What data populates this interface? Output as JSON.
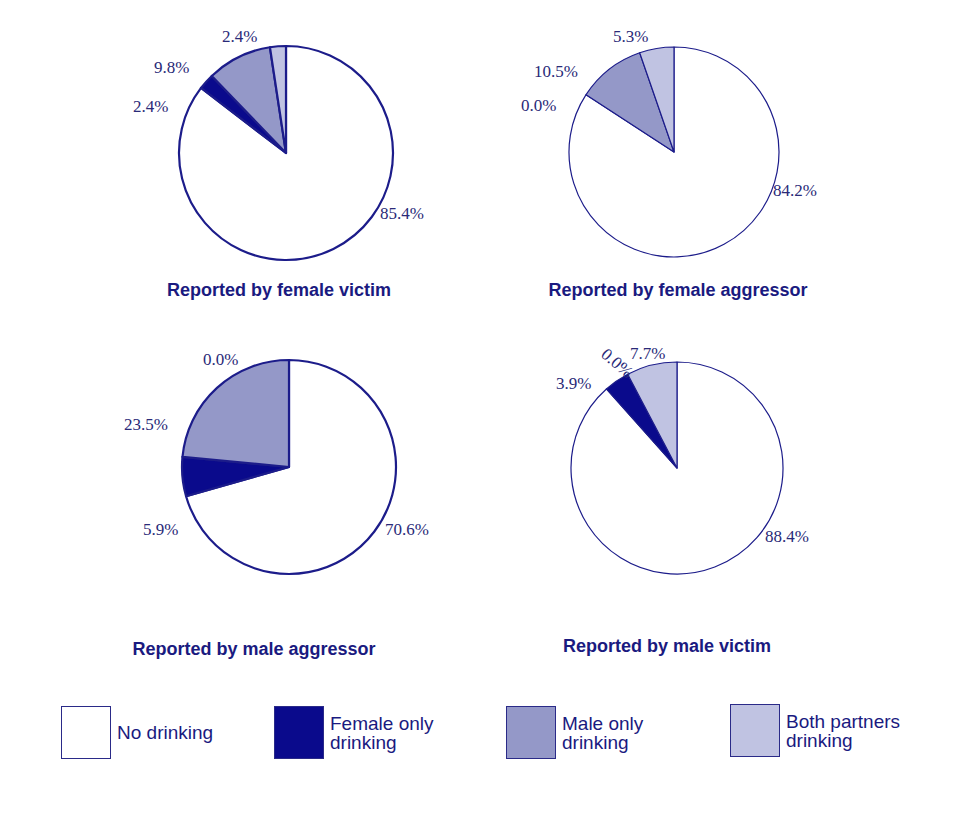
{
  "title_fragment": "",
  "colors": {
    "outline": "#1c1c8a",
    "no_drinking": "#ffffff",
    "female_only": "#0a0a8c",
    "male_only": "#9498c8",
    "both": "#c0c3e2",
    "text": "#1a1a80"
  },
  "legend": {
    "items": [
      {
        "key": "no_drinking",
        "label_line1": "No drinking",
        "label_line2": ""
      },
      {
        "key": "female_only",
        "label_line1": "Female only",
        "label_line2": "drinking"
      },
      {
        "key": "male_only",
        "label_line1": "Male only",
        "label_line2": "drinking"
      },
      {
        "key": "both",
        "label_line1": "Both partners",
        "label_line2": "drinking"
      }
    ]
  },
  "chart_data": [
    {
      "type": "pie",
      "title": "Reported by female victim",
      "categories": [
        "No drinking",
        "Female only drinking",
        "Male only drinking",
        "Both partners drinking"
      ],
      "values": [
        85.4,
        2.4,
        9.8,
        2.4
      ],
      "labels": [
        "85.4%",
        "2.4%",
        "9.8%",
        "2.4%"
      ],
      "layout": {
        "cx": 286,
        "cy": 153,
        "r": 107,
        "stroke_width": 2.2,
        "label_pos": [
          [
            380,
            219
          ],
          [
            133,
            112
          ],
          [
            154,
            73
          ],
          [
            222,
            42
          ]
        ],
        "label_rot": [
          0,
          0,
          0,
          0
        ],
        "caption_pos": [
          279,
          291
        ]
      }
    },
    {
      "type": "pie",
      "title": "Reported by female aggressor",
      "categories": [
        "No drinking",
        "Female only drinking",
        "Male only drinking",
        "Both partners drinking"
      ],
      "values": [
        84.2,
        0.0,
        10.5,
        5.3
      ],
      "labels": [
        "84.2%",
        "0.0%",
        "10.5%",
        "5.3%"
      ],
      "layout": {
        "cx": 674,
        "cy": 152,
        "r": 105,
        "stroke_width": 1.2,
        "label_pos": [
          [
            773,
            196
          ],
          [
            521,
            111
          ],
          [
            534,
            77
          ],
          [
            613,
            42
          ]
        ],
        "label_rot": [
          0,
          0,
          0,
          0
        ],
        "caption_pos": [
          678,
          291
        ]
      }
    },
    {
      "type": "pie",
      "title": "Reported by male aggressor",
      "categories": [
        "No drinking",
        "Female only drinking",
        "Male only drinking",
        "Both partners drinking"
      ],
      "values": [
        70.6,
        5.9,
        23.5,
        0.0
      ],
      "labels": [
        "70.6%",
        "5.9%",
        "23.5%",
        "0.0%"
      ],
      "layout": {
        "cx": 289,
        "cy": 467,
        "r": 107,
        "stroke_width": 2.2,
        "label_pos": [
          [
            385,
            535
          ],
          [
            143,
            535
          ],
          [
            124,
            430
          ],
          [
            203,
            365
          ]
        ],
        "label_rot": [
          0,
          0,
          0,
          0
        ],
        "caption_pos": [
          254,
          650
        ]
      }
    },
    {
      "type": "pie",
      "title": "Reported by male victim",
      "categories": [
        "No drinking",
        "Female only drinking",
        "Male only drinking",
        "Both partners drinking"
      ],
      "values": [
        88.4,
        3.9,
        0.0,
        7.7
      ],
      "labels": [
        "88.4%",
        "3.9%",
        "0.0%",
        "7.7%"
      ],
      "layout": {
        "cx": 677,
        "cy": 468,
        "r": 106,
        "stroke_width": 1.2,
        "label_pos": [
          [
            765,
            542
          ],
          [
            556,
            389
          ],
          [
            600,
            356
          ],
          [
            630,
            359
          ]
        ],
        "label_rot": [
          0,
          0,
          40,
          0
        ],
        "caption_pos": [
          667,
          647
        ]
      }
    }
  ]
}
